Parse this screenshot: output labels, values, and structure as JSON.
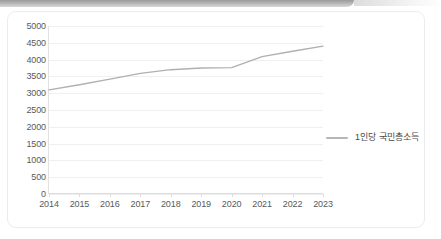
{
  "window": {
    "top_bar_color": "#a8a8a8",
    "card_background": "#ffffff",
    "card_border_color": "#ececec"
  },
  "chart_data": {
    "type": "line",
    "title": "",
    "subtitle": "",
    "xlabel": "",
    "ylabel": "",
    "categories": [
      "2014",
      "2015",
      "2016",
      "2017",
      "2018",
      "2019",
      "2020",
      "2021",
      "2022",
      "2023"
    ],
    "series": [
      {
        "name": "1인당 국민총소득",
        "color": "#b0b0b0",
        "values": [
          3100,
          3250,
          3420,
          3590,
          3700,
          3750,
          3760,
          4090,
          4250,
          4400
        ]
      }
    ],
    "ylim": [
      0,
      5000
    ],
    "y_ticks": [
      5000,
      4500,
      4000,
      3500,
      3000,
      2500,
      2000,
      1500,
      1000,
      500,
      0
    ],
    "y_tick_labels": [
      "5000",
      "4500",
      "4000",
      "3500",
      "3000",
      "2500",
      "2000",
      "1500",
      "1000",
      "500",
      "0"
    ],
    "x_tick_labels": [
      "2014",
      "2015",
      "2016",
      "2017",
      "2018",
      "2019",
      "2020",
      "2021",
      "2022",
      "2023"
    ],
    "grid": true,
    "grid_color": "#f0f0f0",
    "legend": {
      "position": "right",
      "entries": [
        {
          "label": "1인당 국민총소득",
          "color": "#b6b6b6"
        }
      ]
    },
    "axis_color": "#dcdcdc",
    "tick_label_color": "#595959"
  }
}
